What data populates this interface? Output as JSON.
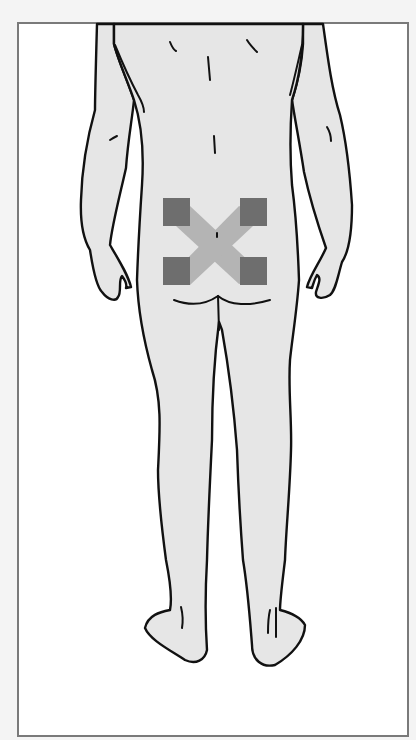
{
  "diagram": {
    "caption": "Electrode pad placement, lower back (posterior view)",
    "view": "posterior",
    "colors": {
      "frame_border": "#7a7a7a",
      "skin": "#e6e6e6",
      "outline": "#111111",
      "electrode_pad": "#6e6e6e",
      "crossing_band": "#b4b4b4"
    },
    "electrodes": [
      {
        "id": "upper-left",
        "x": 163,
        "y": 198,
        "w": 27,
        "h": 28
      },
      {
        "id": "upper-right",
        "x": 240,
        "y": 198,
        "w": 27,
        "h": 28
      },
      {
        "id": "lower-left",
        "x": 163,
        "y": 257,
        "w": 27,
        "h": 28
      },
      {
        "id": "lower-right",
        "x": 240,
        "y": 257,
        "w": 27,
        "h": 28
      }
    ]
  }
}
